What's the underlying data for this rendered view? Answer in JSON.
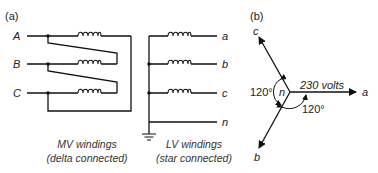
{
  "panel_a": {
    "tag": "(a)",
    "mv": {
      "phases": [
        "A",
        "B",
        "C"
      ],
      "caption_line1": "MV windings",
      "caption_line2": "(delta connected)"
    },
    "lv": {
      "phases": [
        "a",
        "b",
        "c",
        "n"
      ],
      "caption_line1": "LV windings",
      "caption_line2": "(star connected)"
    }
  },
  "panel_b": {
    "tag": "(b)",
    "phasors": [
      "a",
      "b",
      "c"
    ],
    "neutral": "n",
    "magnitude_label": "230 volts",
    "angle_left": "120°",
    "angle_bottom": "120°"
  },
  "colors": {
    "line": "#111111",
    "background": "#ffffff"
  }
}
